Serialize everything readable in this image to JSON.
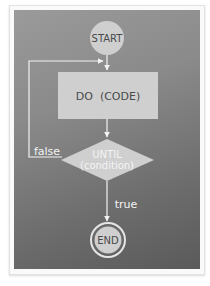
{
  "diagram": {
    "type": "flowchart",
    "nodes": {
      "start": {
        "label": "START",
        "shape": "circle"
      },
      "process": {
        "label": "DO  (CODE)",
        "shape": "rectangle"
      },
      "decision": {
        "line1": "UNTIL",
        "line2": "(condition)",
        "shape": "diamond"
      },
      "end": {
        "label": "END",
        "shape": "double-circle"
      }
    },
    "edges": {
      "false_label": "false",
      "true_label": "true"
    },
    "colors": {
      "node_fill": "#cfcfcf",
      "node_text": "#4a4a4a",
      "line": "#f2f2f2",
      "panel_light": "#9a9a9a",
      "panel_dark": "#5a5a5a"
    }
  }
}
